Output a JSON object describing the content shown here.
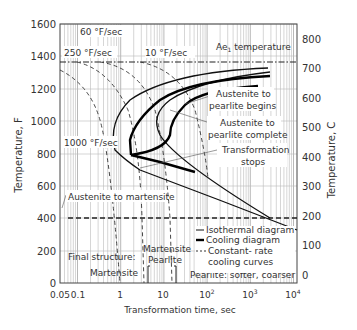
{
  "chart_data": {
    "type": "line",
    "title": "",
    "xlabel": "Transformation time, sec",
    "ylabel": "Temperature, F",
    "ylabel_right": "Temperature, C",
    "xscale": "log",
    "xlim": [
      0.05,
      10000
    ],
    "ylim": [
      0,
      1600
    ],
    "ylim_right": [
      0,
      870
    ],
    "x_ticks": [
      "0.05",
      "0.1",
      "1",
      "10",
      "10^2",
      "10^3",
      "10^4"
    ],
    "y_ticks": [
      "0",
      "200",
      "400",
      "600",
      "800",
      "1000",
      "1200",
      "1400",
      "1600"
    ],
    "y_ticks_right": [
      "0",
      "100",
      "200",
      "300",
      "400",
      "500",
      "600",
      "700",
      "800"
    ],
    "grid": true,
    "reference_lines": [
      {
        "label": "Ae1 temperature",
        "y": 1333,
        "style": "dash-dot"
      },
      {
        "label": "Austenite to martensite",
        "y": 400,
        "style": "dashed"
      }
    ],
    "series": [
      {
        "name": "Austenite to pearlite begins (isothermal)",
        "style": "thin",
        "points": [
          [
            1700,
            1310
          ],
          [
            100,
            1260
          ],
          [
            10,
            1200
          ],
          [
            3,
            1130
          ],
          [
            1.6,
            1050
          ],
          [
            1.5,
            1000
          ],
          [
            1.8,
            920
          ],
          [
            2.2,
            850
          ],
          [
            10,
            700
          ],
          [
            100,
            560
          ],
          [
            1000,
            430
          ],
          [
            10000,
            420
          ]
        ]
      },
      {
        "name": "Austenite to pearlite complete (isothermal)",
        "style": "thin",
        "points": [
          [
            2000,
            1290
          ],
          [
            200,
            1240
          ],
          [
            30,
            1180
          ],
          [
            10,
            1120
          ],
          [
            6,
            1050
          ],
          [
            7,
            980
          ],
          [
            10,
            920
          ],
          [
            40,
            820
          ],
          [
            300,
            700
          ],
          [
            2000,
            410
          ]
        ]
      },
      {
        "name": "Austenite to pearlite begins (cooling)",
        "style": "thick",
        "points": [
          [
            1700,
            1300
          ],
          [
            200,
            1250
          ],
          [
            30,
            1190
          ],
          [
            8,
            1120
          ],
          [
            4,
            1040
          ],
          [
            3,
            960
          ],
          [
            2.7,
            880
          ],
          [
            2.7,
            840
          ]
        ]
      },
      {
        "name": "Austenite to pearlite complete (cooling)",
        "style": "thick",
        "points": [
          [
            1100,
            1240
          ],
          [
            100,
            1170
          ],
          [
            25,
            1110
          ],
          [
            12,
            1040
          ],
          [
            9,
            960
          ],
          [
            6.5,
            880
          ],
          [
            2.7,
            840
          ]
        ]
      },
      {
        "name": "Transformation stops",
        "style": "thick",
        "points": [
          [
            2.7,
            840
          ],
          [
            30,
            800
          ],
          [
            150,
            760
          ]
        ]
      },
      {
        "name": "1000 °F/sec",
        "style": "dashed",
        "points": [
          [
            0.05,
            1290
          ],
          [
            0.2,
            1150
          ],
          [
            0.5,
            900
          ],
          [
            1,
            400
          ],
          [
            1.2,
            0
          ]
        ]
      },
      {
        "name": "250 °F/sec",
        "style": "dashed",
        "points": [
          [
            0.1,
            1333
          ],
          [
            0.6,
            1200
          ],
          [
            1.5,
            1000
          ],
          [
            2.5,
            840
          ],
          [
            3.5,
            400
          ],
          [
            4,
            0
          ]
        ]
      },
      {
        "name": "60 °F/sec",
        "style": "dashed",
        "points": [
          [
            0.8,
            1333
          ],
          [
            3,
            1200
          ],
          [
            5,
            1050
          ],
          [
            8,
            880
          ],
          [
            12,
            600
          ],
          [
            15,
            400
          ],
          [
            17,
            0
          ]
        ]
      },
      {
        "name": "10 °F/sec",
        "style": "dashed",
        "points": [
          [
            3,
            1333
          ],
          [
            12,
            1240
          ],
          [
            25,
            1100
          ],
          [
            40,
            950
          ],
          [
            50,
            860
          ]
        ]
      }
    ],
    "annotations": [
      "60 °F/sec",
      "250 °F/sec",
      "10 °F/sec",
      "1000 °F/sec",
      "Ae1 temperature",
      "Austenite to pearlite begins",
      "Austenite to pearlite complete",
      "Transformation stops",
      "Austenite to martensite",
      "Final structure:",
      "Martensite",
      "Martensite Pearlite",
      "Pearlite: softer, coarser"
    ],
    "legend": {
      "position": "lower right",
      "entries": [
        {
          "label": "Isothermal diagram",
          "style": "thin"
        },
        {
          "label": "Cooling diagram",
          "style": "thick"
        },
        {
          "label": "Constant-rate cooling curves",
          "style": "dashed"
        }
      ]
    }
  },
  "labels": {
    "xlabel": "Transformation time, sec",
    "ylabel": "Temperature, F",
    "ylabel_right": "Temperature, C",
    "rate_60": "60 °F/sec",
    "rate_250": "250 °F/sec",
    "rate_10": "10 °F/sec",
    "rate_1000": "1000 °F/sec",
    "ae1": "Ae",
    "ae1_sub": "1",
    "ae1_rest": " temperature",
    "begins_1": "Austenite to",
    "begins_2": "pearlite begins",
    "complete_1": "Austenite to",
    "complete_2": "pearlite complete",
    "stops_1": "Transformation",
    "stops_2": "stops",
    "martensite_line": "Austenite to martensite",
    "final_structure": "Final structure:",
    "martensite": "Martensite",
    "mp_1": "Martensite",
    "mp_2": "Pearlite",
    "pearlite": "Pearlite: softer, coarser",
    "legend_iso": "Isothermal diagram",
    "legend_cool": "Cooling diagram",
    "legend_rate_1": "Constant- rate",
    "legend_rate_2": "cooling curves"
  },
  "ticks": {
    "y_left": [
      "1600",
      "1400",
      "1200",
      "1000",
      "800",
      "600",
      "400",
      "200",
      "0"
    ],
    "y_right": [
      "800",
      "700",
      "600",
      "500",
      "400",
      "300",
      "200",
      "100",
      "0"
    ],
    "x": [
      "0.05",
      "0.1",
      "1",
      "10",
      "10",
      "10",
      "10"
    ],
    "x_exp": [
      "",
      "",
      "",
      "",
      "2",
      "3",
      "4"
    ]
  }
}
